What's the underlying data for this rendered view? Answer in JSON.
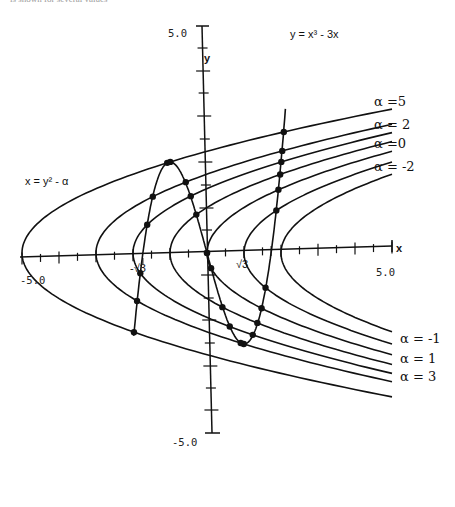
{
  "caption_fragment": "is shown for several values",
  "axes": {
    "x_label": "x",
    "y_label": "y",
    "x_min_label": "-5.0",
    "x_max_label": "5.0",
    "y_max_label": "5.0",
    "y_min_label": "-5.0",
    "neg_sqrt3_label": "-√3",
    "pos_sqrt3_label": "√3"
  },
  "equations": {
    "cubic": "y = x³ - 3x",
    "parabola": "x = y² - α"
  },
  "alpha_labels": [
    {
      "text": "α =5",
      "value": 5
    },
    {
      "text": "α = 2",
      "value": 2
    },
    {
      "text": "α =0",
      "value": 0
    },
    {
      "text": "α = -2",
      "value": -2
    },
    {
      "text": "α = -1",
      "value": -1
    },
    {
      "text": "α = 1",
      "value": 1
    },
    {
      "text": "α = 3",
      "value": 3
    }
  ],
  "chart_data": {
    "type": "line",
    "title": "",
    "xlabel": "x",
    "ylabel": "y",
    "xlim": [
      -5,
      5
    ],
    "ylim": [
      -5,
      5
    ],
    "curves": [
      {
        "name": "y = x^3 - 3x",
        "kind": "cubic"
      },
      {
        "name": "x = y^2 - alpha",
        "kind": "parabola_family",
        "alphas": [
          5,
          3,
          2,
          1,
          0,
          -1,
          -2
        ]
      }
    ],
    "special_ticks": [
      "-√3",
      "√3"
    ],
    "intersection_points_marked": true
  },
  "colors": {
    "ink": "#111111",
    "background": "#ffffff"
  }
}
